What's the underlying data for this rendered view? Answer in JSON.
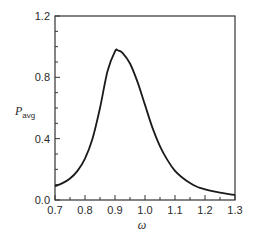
{
  "chart_data": {
    "type": "line",
    "title": "",
    "xlabel": "ω",
    "ylabel": "P",
    "ylabel_subscript": "avg",
    "xlim": [
      0.7,
      1.3
    ],
    "ylim": [
      0.0,
      1.2
    ],
    "grid": false,
    "legend": null,
    "x_ticks": [
      "0.7",
      "0.8",
      "0.9",
      "1.0",
      "1.1",
      "1.2",
      "1.3"
    ],
    "y_ticks": [
      "0.0",
      "0.4",
      "0.8",
      "1.2"
    ],
    "series": [
      {
        "name": "P_avg",
        "x": [
          0.7,
          0.725,
          0.75,
          0.775,
          0.8,
          0.825,
          0.85,
          0.875,
          0.9,
          0.91,
          0.925,
          0.95,
          0.975,
          1.0,
          1.025,
          1.05,
          1.075,
          1.1,
          1.125,
          1.15,
          1.175,
          1.2,
          1.225,
          1.25,
          1.275,
          1.3
        ],
        "values": [
          0.09,
          0.11,
          0.14,
          0.19,
          0.27,
          0.4,
          0.6,
          0.84,
          0.97,
          0.975,
          0.96,
          0.89,
          0.77,
          0.62,
          0.47,
          0.35,
          0.26,
          0.19,
          0.145,
          0.11,
          0.085,
          0.07,
          0.058,
          0.048,
          0.04,
          0.033
        ]
      }
    ]
  }
}
